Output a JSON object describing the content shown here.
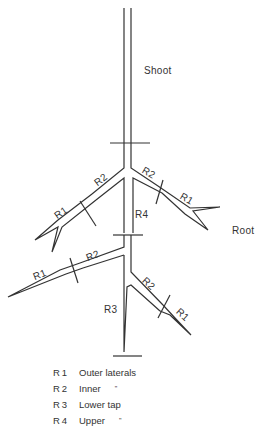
{
  "diagram": {
    "labels": {
      "shoot": "Shoot",
      "root": "Root"
    },
    "branch_labels": {
      "upper_left_r2": "R2",
      "upper_left_r1": "R1",
      "upper_right_r2": "R2",
      "upper_right_r1": "R1",
      "r4": "R4",
      "lower_left_r2": "R2",
      "lower_left_r1": "R1",
      "lower_right_r2": "R2",
      "lower_right_r1": "R1",
      "r3": "R3"
    },
    "legend": [
      {
        "code": "R1",
        "desc": "Outer laterals",
        "ditto": ""
      },
      {
        "code": "R2",
        "desc": "Inner",
        "ditto": "\""
      },
      {
        "code": "R3",
        "desc": "Lower tap",
        "ditto": ""
      },
      {
        "code": "R4",
        "desc": "Upper",
        "ditto": "\""
      }
    ],
    "line_color": "#333333"
  }
}
